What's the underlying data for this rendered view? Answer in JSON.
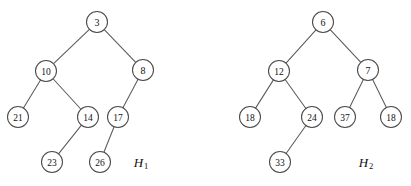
{
  "figure": {
    "background_color": "#ffffff",
    "node_fill": "#ffffff",
    "node_stroke": "#4a4a4a",
    "edge_stroke": "#5a5a5a",
    "node_radius": 10.5,
    "width": 411,
    "height": 186
  },
  "chart_data": {
    "type": "diagram",
    "subtype": "binary-tree",
    "title": "",
    "xlabel": "",
    "ylabel": "",
    "trees": [
      {
        "name": "H",
        "subscript": "1",
        "label_x": 141,
        "label_y": 162,
        "root": "n1",
        "nodes": [
          {
            "id": "n1",
            "value": "3",
            "x": 97,
            "y": 22,
            "depth": 0
          },
          {
            "id": "n2",
            "value": "10",
            "x": 46,
            "y": 71,
            "depth": 1
          },
          {
            "id": "n3",
            "value": "8",
            "x": 143,
            "y": 70,
            "depth": 1
          },
          {
            "id": "n4",
            "value": "21",
            "x": 18,
            "y": 117,
            "depth": 2
          },
          {
            "id": "n5",
            "value": "14",
            "x": 88,
            "y": 117,
            "depth": 2
          },
          {
            "id": "n6",
            "value": "17",
            "x": 118,
            "y": 117,
            "depth": 2
          },
          {
            "id": "n7",
            "value": "23",
            "x": 52,
            "y": 162,
            "depth": 3
          },
          {
            "id": "n8",
            "value": "26",
            "x": 100,
            "y": 162,
            "depth": 3
          }
        ],
        "edges": [
          {
            "from": "n1",
            "to": "n2"
          },
          {
            "from": "n1",
            "to": "n3"
          },
          {
            "from": "n2",
            "to": "n4"
          },
          {
            "from": "n2",
            "to": "n5"
          },
          {
            "from": "n3",
            "to": "n6"
          },
          {
            "from": "n5",
            "to": "n7"
          },
          {
            "from": "n6",
            "to": "n8"
          }
        ]
      },
      {
        "name": "H",
        "subscript": "2",
        "label_x": 366,
        "label_y": 162,
        "root": "m1",
        "nodes": [
          {
            "id": "m1",
            "value": "6",
            "x": 323,
            "y": 22,
            "depth": 0
          },
          {
            "id": "m2",
            "value": "12",
            "x": 279,
            "y": 71,
            "depth": 1
          },
          {
            "id": "m3",
            "value": "7",
            "x": 368,
            "y": 70,
            "depth": 1
          },
          {
            "id": "m4",
            "value": "18",
            "x": 250,
            "y": 117,
            "depth": 2
          },
          {
            "id": "m5",
            "value": "24",
            "x": 312,
            "y": 117,
            "depth": 2
          },
          {
            "id": "m6",
            "value": "37",
            "x": 345,
            "y": 117,
            "depth": 2
          },
          {
            "id": "m7",
            "value": "18",
            "x": 391,
            "y": 117,
            "depth": 2
          },
          {
            "id": "m8",
            "value": "33",
            "x": 280,
            "y": 162,
            "depth": 3
          }
        ],
        "edges": [
          {
            "from": "m1",
            "to": "m2"
          },
          {
            "from": "m1",
            "to": "m3"
          },
          {
            "from": "m2",
            "to": "m4"
          },
          {
            "from": "m2",
            "to": "m5"
          },
          {
            "from": "m3",
            "to": "m6"
          },
          {
            "from": "m3",
            "to": "m7"
          },
          {
            "from": "m5",
            "to": "m8"
          }
        ]
      }
    ]
  }
}
